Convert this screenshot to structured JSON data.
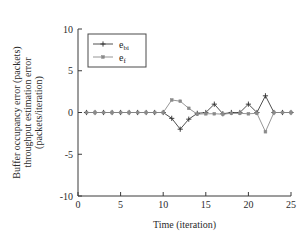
{
  "chart_data": {
    "type": "line",
    "title": "",
    "xlabel": "Time (iteration)",
    "ylabel": "Buffer occupancy error (packets)\nthroughput estimation error\n(packets/iteration)",
    "ylabel_lines": [
      "Buffer occupancy error (packets)",
      "throughput estimation error",
      "(packets/iteration)"
    ],
    "xlim": [
      0,
      25
    ],
    "ylim": [
      -10,
      10
    ],
    "xticks": [
      0,
      5,
      10,
      15,
      20,
      25
    ],
    "yticks": [
      -10,
      -5,
      0,
      5,
      10
    ],
    "xtick_labels": [
      "0",
      "5",
      "10",
      "15",
      "20",
      "25"
    ],
    "ytick_labels": [
      "-10",
      "-5",
      "0",
      "5",
      "10"
    ],
    "grid": false,
    "legend_position": "upper left",
    "x": [
      1,
      2,
      3,
      4,
      5,
      6,
      7,
      8,
      9,
      10,
      11,
      12,
      13,
      14,
      15,
      16,
      17,
      18,
      19,
      20,
      21,
      22,
      23,
      24,
      25
    ],
    "series": [
      {
        "name": "e_bi",
        "label": "e",
        "sublabel": "bi",
        "marker": "plus",
        "color": "#3c3c3c",
        "values": [
          0,
          0,
          0,
          0,
          0,
          0,
          0,
          0,
          0,
          0,
          -0.7,
          -2.0,
          -0.8,
          -0.1,
          0,
          1.0,
          -0.15,
          0,
          0,
          1.0,
          0,
          2.0,
          0,
          0,
          0
        ]
      },
      {
        "name": "e_f",
        "label": "e",
        "sublabel": "f",
        "marker": "square",
        "color": "#8a8a8a",
        "values": [
          0,
          0,
          0,
          0,
          0,
          0,
          0,
          0,
          0,
          0,
          1.5,
          1.35,
          0.5,
          -0.2,
          -0.15,
          -0.15,
          -0.2,
          -0.1,
          -0.1,
          -0.15,
          -0.1,
          -2.3,
          0,
          0,
          0
        ]
      }
    ]
  },
  "legend": {
    "entries": [
      {
        "label": "e",
        "sub": "bi",
        "marker": "plus"
      },
      {
        "label": "e",
        "sub": "f",
        "marker": "square"
      }
    ]
  }
}
